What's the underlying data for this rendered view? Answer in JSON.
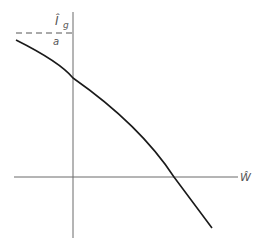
{
  "diagram": {
    "y_axis_label": "Î",
    "y_axis_subscript": "g",
    "x_axis_label": "Ŵ",
    "intercept_label": "a",
    "colors": {
      "axis": "#6a6a6a",
      "curve": "#1a1a1a",
      "dashed": "#555555",
      "background": "#ffffff"
    }
  }
}
